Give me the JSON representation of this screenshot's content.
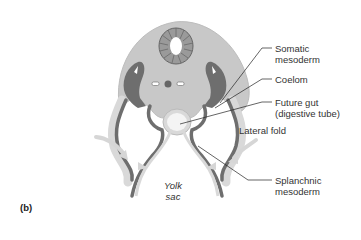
{
  "figure": {
    "panel_label": "(b)",
    "colors": {
      "background": "#ffffff",
      "body_outer": "#c8c8c8",
      "body_inner": "#b9b9b9",
      "dark_mesoderm": "#6e6e6e",
      "light_layer": "#d9d9d9",
      "gut_fill": "#f4f4f4",
      "neural_tube_segments": "#8c8c8c",
      "arrow": "#d6d6d6",
      "leader_line": "#222222",
      "text": "#333333"
    },
    "labels": {
      "somatic_mesoderm": [
        "Somatic",
        "mesoderm"
      ],
      "coelom": "Coelom",
      "future_gut": [
        "Future gut",
        "(digestive tube)"
      ],
      "lateral_fold": "Lateral fold",
      "splanchnic_mesoderm": [
        "Splanchnic",
        "mesoderm"
      ],
      "yolk_sac": [
        "Yolk",
        "sac"
      ]
    }
  }
}
